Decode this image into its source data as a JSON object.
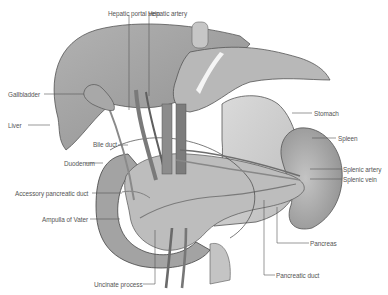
{
  "figure": {
    "type": "anatomical-diagram"
  },
  "colors": {
    "liver": "#9d9d9d",
    "liver_light": "#b4b4b4",
    "stomach": "#cdcdcd",
    "spleen": "#a9a9a9",
    "pancreas": "#bdbdbd",
    "duodenum": "#a3a3a3",
    "vessel": "#6e6e6e",
    "outline": "#444444",
    "leader": "#555555",
    "label_text": "#555555"
  },
  "labels": {
    "hepatic_portal_vein": "Hepatic portal vein",
    "hepatic_artery": "Hepatic artery",
    "gallbladder": "Gallbladder",
    "liver": "Liver",
    "bile_duct": "Bile duct",
    "duodenum": "Duodenum",
    "accessory_pancreatic_duct": "Accessory pancreatic duct",
    "ampulla_of_vater": "Ampulla of Vater",
    "uncinate_process": "Uncinate process",
    "stomach": "Stomach",
    "spleen": "Spleen",
    "splenic_artery": "Splenic artery",
    "splenic_vein": "Splenic vein",
    "pancreas": "Pancreas",
    "pancreatic_duct": "Pancreatic duct"
  }
}
